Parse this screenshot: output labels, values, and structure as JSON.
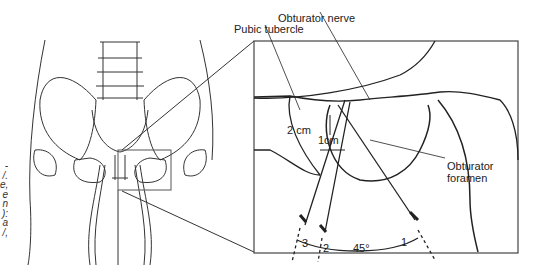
{
  "figure": {
    "labels": {
      "obturator_nerve": "Obturator nerve",
      "pubic_tubercle": "Pubic tubercle",
      "obturator_foramen_1": "Obturator",
      "obturator_foramen_2": "foramen",
      "dist_2cm": "2 cm",
      "dist_1cm": "1cm",
      "angle": "45°",
      "needle_1": "1",
      "needle_2": "2",
      "needle_3": "3"
    },
    "caption_fragments": [
      "-",
      "/.",
      "e,",
      "e",
      "n",
      "):",
      "a",
      "/,"
    ]
  }
}
